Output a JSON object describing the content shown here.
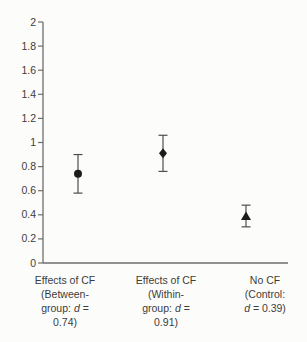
{
  "figure": {
    "kind": "scanned-statistical-figure",
    "background": "#fcfcfb"
  },
  "chart_data": {
    "type": "scatter",
    "title": "",
    "xlabel": "",
    "ylabel": "",
    "ylim": [
      0,
      2
    ],
    "ytick_labels": [
      "0",
      "0.2",
      "0.4",
      "0.6",
      "0.8",
      "1",
      "1.2",
      "1.4",
      "1.6",
      "1.8",
      "2"
    ],
    "yticks": [
      0,
      0.2,
      0.4,
      0.6,
      0.8,
      1,
      1.2,
      1.4,
      1.6,
      1.8,
      2
    ],
    "grid": false,
    "legend_position": "none",
    "error_bars": true,
    "series": [
      {
        "name": "Effects of CF (Between-group)",
        "marker": "circle",
        "value": 0.74,
        "ci_low": 0.58,
        "ci_high": 0.9,
        "label_lines": [
          "Effects of CF",
          "(Between-",
          "group: d =",
          "0.74)"
        ]
      },
      {
        "name": "Effects of CF (Within-group)",
        "marker": "diamond",
        "value": 0.91,
        "ci_low": 0.76,
        "ci_high": 1.06,
        "label_lines": [
          "Effects of CF",
          "(Within-",
          "group: d =",
          "0.91)"
        ]
      },
      {
        "name": "No CF (Control)",
        "marker": "triangle",
        "value": 0.39,
        "ci_low": 0.3,
        "ci_high": 0.48,
        "label_lines": [
          "No CF",
          "(Control:",
          "d = 0.39)"
        ]
      }
    ],
    "colors": {
      "marker": "#1c1c1c",
      "axis": "#6e6e6e",
      "error_bar": "#4d4d4d",
      "text": "#3c3c3c"
    }
  }
}
